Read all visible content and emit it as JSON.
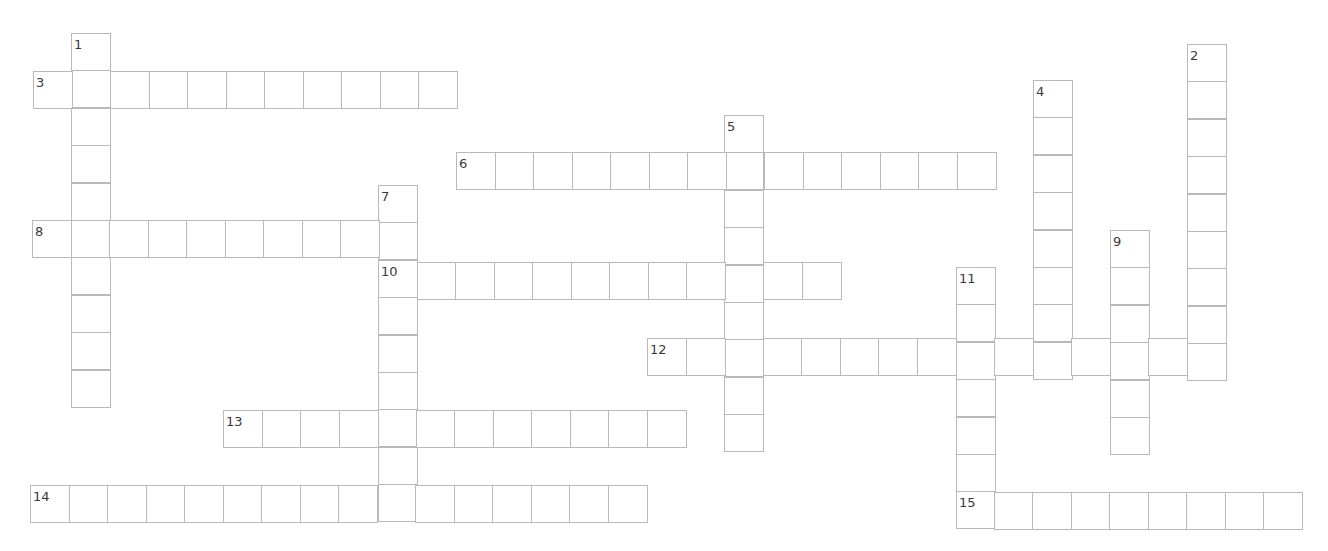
{
  "puzzle": {
    "cell_width": 38.5,
    "cell_height": 37.4,
    "line_color": "#b9b9b9",
    "number_color": "#3a3a3a",
    "entries": [
      {
        "number": "1",
        "direction": "down",
        "x": 71,
        "y": 33,
        "length": 10
      },
      {
        "number": "2",
        "direction": "down",
        "x": 1187,
        "y": 44,
        "length": 9
      },
      {
        "number": "3",
        "direction": "across",
        "x": 33,
        "y": 71,
        "length": 11
      },
      {
        "number": "4",
        "direction": "down",
        "x": 1033,
        "y": 80,
        "length": 8
      },
      {
        "number": "5",
        "direction": "down",
        "x": 724,
        "y": 115,
        "length": 9
      },
      {
        "number": "6",
        "direction": "across",
        "x": 456,
        "y": 152,
        "length": 14
      },
      {
        "number": "7",
        "direction": "down",
        "x": 378,
        "y": 185,
        "length": 9
      },
      {
        "number": "8",
        "direction": "across",
        "x": 32,
        "y": 220,
        "length": 10
      },
      {
        "number": "9",
        "direction": "down",
        "x": 1110,
        "y": 230,
        "length": 6
      },
      {
        "number": "10",
        "direction": "across",
        "x": 378,
        "y": 262,
        "length": 12
      },
      {
        "number": "11",
        "direction": "down",
        "x": 956,
        "y": 267,
        "length": 7
      },
      {
        "number": "12",
        "direction": "across",
        "x": 647,
        "y": 338,
        "length": 15
      },
      {
        "number": "13",
        "direction": "across",
        "x": 223,
        "y": 410,
        "length": 12
      },
      {
        "number": "14",
        "direction": "across",
        "x": 30,
        "y": 485,
        "length": 16
      },
      {
        "number": "15",
        "direction": "across",
        "x": 955,
        "y": 492,
        "length": 9
      }
    ]
  }
}
